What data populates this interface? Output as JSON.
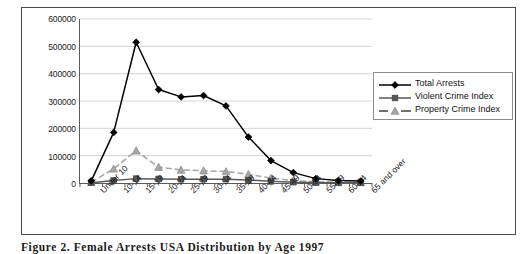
{
  "caption": "Figure 2. Female Arrests USA Distribution by Age 1997",
  "legend": {
    "position": "top-right-outside",
    "items": [
      {
        "label": "Total Arrests",
        "marker": "diamond",
        "color": "#000000",
        "style": "solid"
      },
      {
        "label": "Violent Crime Index",
        "marker": "square",
        "color": "#595959",
        "style": "solid"
      },
      {
        "label": "Property Crime Index",
        "marker": "triangle",
        "color": "#a6a6a6",
        "style": "dashed"
      }
    ]
  },
  "axis": {
    "y_ticks": [
      "0",
      "100000",
      "200000",
      "300000",
      "400000",
      "500000",
      "600000"
    ],
    "x_ticks": [
      "Under 10",
      "10-14",
      "15-19",
      "20-24",
      "25-29",
      "30-34",
      "35-39",
      "40-44",
      "45-49",
      "50-54",
      "55-59",
      "60-64",
      "65 and over"
    ]
  },
  "chart_data": {
    "type": "line",
    "title": "",
    "xlabel": "",
    "ylabel": "",
    "ylim": [
      0,
      600000
    ],
    "ytick_interval": 100000,
    "grid": true,
    "legend_position": "right",
    "categories": [
      "Under 10",
      "10-14",
      "15-19",
      "20-24",
      "25-29",
      "30-34",
      "35-39",
      "40-44",
      "45-49",
      "50-54",
      "55-59",
      "60-64",
      "65 and over"
    ],
    "series": [
      {
        "name": "Total Arrests",
        "marker": "diamond",
        "color": "#000000",
        "linestyle": "solid",
        "values": [
          8000,
          185000,
          515000,
          342000,
          315000,
          320000,
          282000,
          168000,
          82000,
          38000,
          16000,
          9000,
          7000
        ]
      },
      {
        "name": "Violent Crime Index",
        "marker": "square",
        "color": "#595959",
        "linestyle": "solid",
        "values": [
          1000,
          9000,
          16000,
          15000,
          14000,
          14000,
          14000,
          11000,
          6000,
          3000,
          1500,
          1000,
          800
        ]
      },
      {
        "name": "Property Crime Index",
        "marker": "triangle",
        "color": "#a6a6a6",
        "linestyle": "dashed",
        "values": [
          3000,
          52000,
          118000,
          58000,
          48000,
          45000,
          42000,
          32000,
          18000,
          9000,
          4000,
          2500,
          2000
        ]
      }
    ]
  }
}
